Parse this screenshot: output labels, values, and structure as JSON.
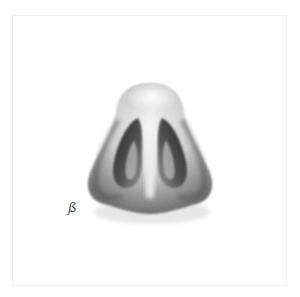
{
  "image": {
    "subject": "Anatomical illustration of a human nose viewed from below",
    "background": "#ffffff",
    "border_color": "#f1f1f1",
    "shading_color": "#2a2a2a",
    "signature": "ß"
  }
}
